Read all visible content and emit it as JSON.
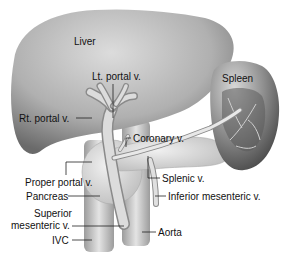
{
  "diagram": {
    "labels": {
      "liver": "Liver",
      "lt_portal": "Lt. portal v.",
      "rt_portal": "Rt. portal v.",
      "spleen": "Spleen",
      "coronary": "Coronary v.",
      "proper_portal": "Proper portal v.",
      "splenic": "Splenic v.",
      "pancreas": "Pancreas",
      "inferior_mesenteric": "Inferior mesenteric v.",
      "superior_mesenteric_1": "Superior",
      "superior_mesenteric_2": "mesenteric v.",
      "ivc": "IVC",
      "aorta": "Aorta"
    },
    "colors": {
      "organ_dark": "#6e6e6e",
      "organ_mid": "#a8a8a8",
      "organ_light": "#d9d9d9",
      "vessel": "#c8c8c8",
      "leader_line": "#222222",
      "background": "#ffffff"
    }
  }
}
